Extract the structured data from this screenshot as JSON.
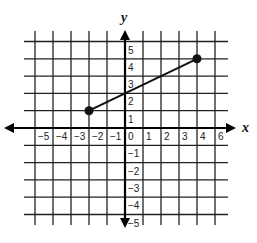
{
  "chart_data": {
    "type": "line",
    "title": "",
    "xlabel": "x",
    "ylabel": "y",
    "xlim": [
      -6,
      6
    ],
    "ylim": [
      -5,
      5
    ],
    "grid": true,
    "x_ticks": [
      -5,
      -4,
      -3,
      -2,
      -1,
      0,
      1,
      2,
      3,
      4,
      5
    ],
    "x_tick_labels": [
      "-5",
      "-4",
      "-3",
      "-2",
      "-1",
      "0",
      "1",
      "2",
      "3",
      "4",
      "6"
    ],
    "y_ticks": [
      5,
      4,
      3,
      2,
      1,
      -1,
      -2,
      -3,
      -4,
      -5
    ],
    "y_tick_labels": [
      "5",
      "4",
      "3",
      "2",
      "1",
      "-1",
      "-2",
      "-3",
      "-4",
      "-5"
    ],
    "series": [
      {
        "name": "segment",
        "points": [
          [
            -2,
            1
          ],
          [
            4,
            4
          ]
        ],
        "endpoints": "closed-dots",
        "color": "#111111"
      }
    ]
  },
  "labels": {
    "x_axis": "x",
    "y_axis": "y"
  }
}
